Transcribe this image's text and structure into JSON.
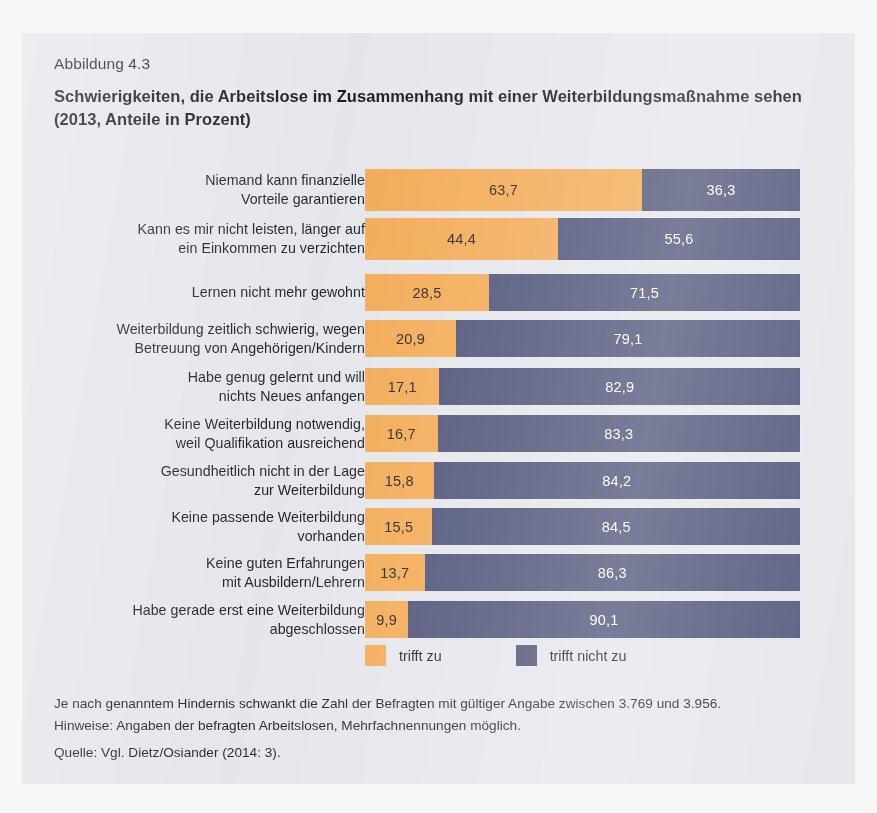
{
  "figure": {
    "label": "Abbildung 4.3",
    "title": "Schwierigkeiten, die Arbeitslose im Zusammenhang mit einer Weiterbildungsmaßnahme sehen (2013, Anteile in Prozent)"
  },
  "legend": {
    "items": [
      {
        "label": "trifft zu",
        "color": "#f2a74e"
      },
      {
        "label": "trifft nicht zu",
        "color": "#464b72"
      }
    ]
  },
  "notes": {
    "line1": "Je nach genanntem Hindernis schwankt die Zahl der Befragten mit gültiger Angabe zwischen 3.769 und 3.956.",
    "line2": "Hinweise: Angaben der befragten Arbeitslosen, Mehrfachnennungen möglich.",
    "source": "Quelle: Vgl. Dietz/Osiander (2014: 3)."
  },
  "chart_data": {
    "type": "bar",
    "orientation": "horizontal",
    "stacked": true,
    "stack_total": 100,
    "title": "Schwierigkeiten, die Arbeitslose im Zusammenhang mit einer Weiterbildungsmaßnahme sehen (2013, Anteile in Prozent)",
    "xlabel": "",
    "ylabel": "",
    "xlim": [
      0,
      100
    ],
    "grid": false,
    "legend_position": "bottom",
    "decimal_separator": ",",
    "categories": [
      "Niemand kann finanzielle Vorteile garantieren",
      "Kann es mir nicht leisten, länger auf ein Einkommen zu verzichten",
      "Lernen nicht mehr gewohnt",
      "Weiterbildung zeitlich schwierig, wegen Betreuung von Angehörigen/Kindern",
      "Habe genug gelernt und will nichts Neues anfangen",
      "Keine Weiterbildung notwendig, weil Qualifikation ausreichend",
      "Gesundheitlich nicht in der Lage zur Weiterbildung",
      "Keine passende Weiterbildung vorhanden",
      "Keine guten Erfahrungen mit Ausbildern/Lehrern",
      "Habe gerade erst eine Weiterbildung abgeschlossen"
    ],
    "series": [
      {
        "name": "trifft zu",
        "color": "#f2a74e",
        "values": [
          63.7,
          44.4,
          28.5,
          20.9,
          17.1,
          16.7,
          15.8,
          15.5,
          13.7,
          9.9
        ],
        "labels": [
          "63,7",
          "44,4",
          "28,5",
          "20,9",
          "17,1",
          "16,7",
          "15,8",
          "15,5",
          "13,7",
          "9,9"
        ]
      },
      {
        "name": "trifft nicht zu",
        "color": "#464b72",
        "values": [
          36.3,
          55.6,
          71.5,
          79.1,
          82.9,
          83.3,
          84.2,
          84.5,
          86.3,
          90.1
        ],
        "labels": [
          "36,3",
          "55,6",
          "71,5",
          "79,1",
          "82,9",
          "83,3",
          "84,2",
          "84,5",
          "86,3",
          "90,1"
        ]
      }
    ],
    "rows": [
      {
        "label_line1": "Niemand kann finanzielle",
        "label_line2": "Vorteile garantieren",
        "a": 63.7,
        "a_label": "63,7",
        "b": 36.3,
        "b_label": "36,3"
      },
      {
        "label_line1": "Kann es mir nicht leisten, länger auf",
        "label_line2": "ein Einkommen zu verzichten",
        "a": 44.4,
        "a_label": "44,4",
        "b": 55.6,
        "b_label": "55,6"
      },
      {
        "label_line1": "Lernen nicht mehr gewohnt",
        "label_line2": "",
        "a": 28.5,
        "a_label": "28,5",
        "b": 71.5,
        "b_label": "71,5"
      },
      {
        "label_line1": "Weiterbildung zeitlich schwierig, wegen",
        "label_line2": "Betreuung von Angehörigen/Kindern",
        "a": 20.9,
        "a_label": "20,9",
        "b": 79.1,
        "b_label": "79,1"
      },
      {
        "label_line1": "Habe genug gelernt und will",
        "label_line2": "nichts Neues anfangen",
        "a": 17.1,
        "a_label": "17,1",
        "b": 82.9,
        "b_label": "82,9"
      },
      {
        "label_line1": "Keine Weiterbildung notwendig,",
        "label_line2": "weil Qualifikation ausreichend",
        "a": 16.7,
        "a_label": "16,7",
        "b": 83.3,
        "b_label": "83,3"
      },
      {
        "label_line1": "Gesundheitlich nicht in der Lage",
        "label_line2": "zur Weiterbildung",
        "a": 15.8,
        "a_label": "15,8",
        "b": 84.2,
        "b_label": "84,2"
      },
      {
        "label_line1": "Keine passende Weiterbildung",
        "label_line2": "vorhanden",
        "a": 15.5,
        "a_label": "15,5",
        "b": 84.5,
        "b_label": "84,5"
      },
      {
        "label_line1": "Keine guten Erfahrungen",
        "label_line2": "mit Ausbildern/Lehrern",
        "a": 13.7,
        "a_label": "13,7",
        "b": 86.3,
        "b_label": "86,3"
      },
      {
        "label_line1": "Habe gerade erst eine Weiterbildung",
        "label_line2": "abgeschlossen",
        "a": 9.9,
        "a_label": "9,9",
        "b": 90.1,
        "b_label": "90,1"
      }
    ]
  }
}
